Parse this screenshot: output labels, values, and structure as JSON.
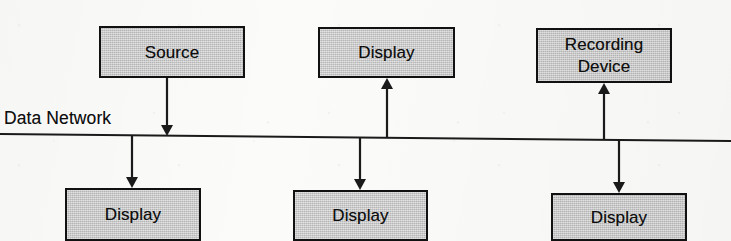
{
  "diagram": {
    "bus": {
      "label": "Data Network",
      "label_x": 4,
      "label_y": 108,
      "x1": 0,
      "y1": 134,
      "x2": 731,
      "y2": 141,
      "stroke": "#1a1a1a",
      "stroke_width": 2
    },
    "style": {
      "box_fill": "#c9c9c9",
      "box_stroke": "#111111",
      "connector_stroke": "#1a1a1a",
      "text_color": "#0d0d0d",
      "background": "#fbfbfa"
    },
    "nodes": [
      {
        "id": "source",
        "label": "Source",
        "row": "top",
        "x": 99,
        "y": 26,
        "w": 146,
        "h": 52,
        "lines": 1
      },
      {
        "id": "display-top",
        "label": "Display",
        "row": "top",
        "x": 318,
        "y": 27,
        "w": 137,
        "h": 51,
        "lines": 1
      },
      {
        "id": "recording",
        "label": "Recording\nDevice",
        "row": "top",
        "x": 536,
        "y": 28,
        "w": 136,
        "h": 55,
        "lines": 2
      },
      {
        "id": "display-bl",
        "label": "Display",
        "row": "bottom",
        "x": 65,
        "y": 188,
        "w": 136,
        "h": 53,
        "lines": 1
      },
      {
        "id": "display-bm",
        "label": "Display",
        "row": "bottom",
        "x": 293,
        "y": 190,
        "w": 135,
        "h": 51,
        "lines": 1
      },
      {
        "id": "display-br",
        "label": "Display",
        "row": "bottom",
        "x": 551,
        "y": 193,
        "w": 136,
        "h": 48,
        "lines": 1
      }
    ],
    "connectors": [
      {
        "id": "source-to-bus",
        "from": "source",
        "to": "bus",
        "direction": "down",
        "x": 167,
        "y_start": 78,
        "y_end": 136,
        "arrow": true
      },
      {
        "id": "bus-to-display-top",
        "from": "bus",
        "to": "display-top",
        "direction": "up",
        "x": 387,
        "y_start": 138,
        "y_end": 78,
        "arrow": true
      },
      {
        "id": "bus-to-recording",
        "from": "bus",
        "to": "recording",
        "direction": "up",
        "x": 604,
        "y_start": 140,
        "y_end": 83,
        "arrow": true
      },
      {
        "id": "bus-to-display-bl",
        "from": "bus",
        "to": "display-bl",
        "direction": "down",
        "x": 132,
        "y_start": 135,
        "y_end": 188,
        "arrow": true
      },
      {
        "id": "bus-to-display-bm",
        "from": "bus",
        "to": "display-bm",
        "direction": "down",
        "x": 360,
        "y_start": 138,
        "y_end": 190,
        "arrow": true
      },
      {
        "id": "bus-to-display-br",
        "from": "bus",
        "to": "display-br",
        "direction": "down",
        "x": 619,
        "y_start": 140,
        "y_end": 193,
        "arrow": true
      }
    ]
  }
}
